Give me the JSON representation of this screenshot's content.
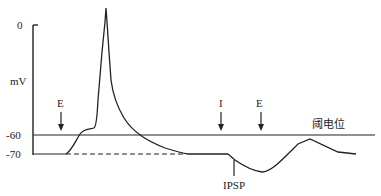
{
  "diagram": {
    "y_axis": {
      "unit_label": "mV",
      "ticks": [
        "0",
        "-60",
        "-70"
      ]
    },
    "threshold_label": "阈电位",
    "stimuli": [
      {
        "label": "E",
        "type": "excitatory"
      },
      {
        "label": "I",
        "type": "inhibitory"
      },
      {
        "label": "E",
        "type": "excitatory"
      }
    ],
    "annotations": {
      "ipsp": "IPSP"
    },
    "colors": {
      "line": "#222222",
      "background": "#ffffff"
    }
  }
}
